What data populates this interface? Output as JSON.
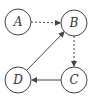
{
  "diagram": {
    "type": "directed-graph",
    "colors": {
      "stroke": "#444444",
      "background": "#ffffff",
      "text": "#333333"
    },
    "nodes": [
      {
        "id": "A",
        "label": "A",
        "cx": 18,
        "cy": 22,
        "r": 13
      },
      {
        "id": "B",
        "label": "B",
        "cx": 74,
        "cy": 23,
        "r": 13
      },
      {
        "id": "C",
        "label": "C",
        "cx": 74,
        "cy": 80,
        "r": 13
      },
      {
        "id": "D",
        "label": "D",
        "cx": 18,
        "cy": 80,
        "r": 13
      }
    ],
    "edges": [
      {
        "from": "A",
        "to": "B",
        "style": "dashed"
      },
      {
        "from": "B",
        "to": "C",
        "style": "dashed"
      },
      {
        "from": "C",
        "to": "D",
        "style": "solid"
      },
      {
        "from": "D",
        "to": "B",
        "style": "solid"
      }
    ]
  }
}
